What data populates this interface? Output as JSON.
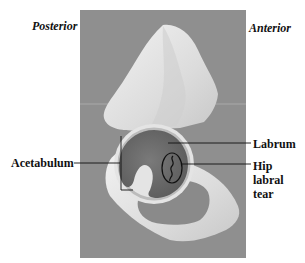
{
  "figure": {
    "orientation_labels": {
      "left": "Posterior",
      "right": "Anterior"
    },
    "annotations": [
      {
        "id": "acetabulum",
        "text": "Acetabulum"
      },
      {
        "id": "labrum",
        "text": "Labrum"
      },
      {
        "id": "tear",
        "lines": [
          "Hip",
          "labral",
          "tear"
        ]
      }
    ],
    "colors": {
      "background": "#ffffff",
      "photo_background": "#8f8f8f",
      "bone": "#e6e6e6",
      "socket": "#6e6e6e",
      "leader_line": "#111111"
    }
  }
}
